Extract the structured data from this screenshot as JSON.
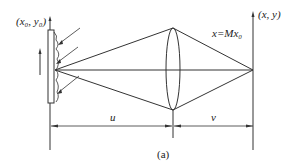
{
  "labels": {
    "object_coords": "(x₀, y₀)",
    "image_coords": "(x, y)",
    "magnification": "x=Mx₀",
    "object_distance": "u",
    "image_distance": "v",
    "caption": "(a)"
  },
  "colors": {
    "line": "#333333",
    "background": "#ffffff"
  }
}
